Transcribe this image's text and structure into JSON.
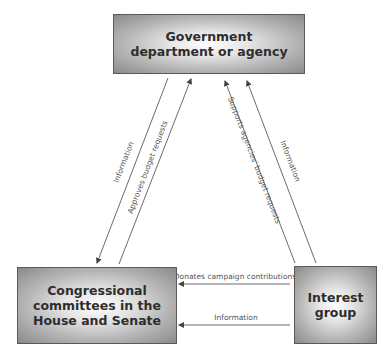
{
  "nodes": {
    "government": {
      "line1": "Government",
      "line2": "department or agency"
    },
    "congress": {
      "line1": "Congressional",
      "line2": "committees in the",
      "line3": "House and Senate"
    },
    "interest_group": {
      "line1": "Interest",
      "line2": "group"
    }
  },
  "edges": {
    "gov_to_congress_info": "Information",
    "congress_to_gov_budget": "Approves budget requests",
    "interest_to_gov_support": "Supports agencies' budget requests",
    "interest_to_gov_info": "Information",
    "interest_to_congress_donations": "Donates campaign contributions",
    "interest_to_congress_info": "Information"
  },
  "colors": {
    "box_border": "#5a5a5a",
    "box_center": "#ffffff",
    "box_edge": "#8a8a8a",
    "text": "#2e2e2e",
    "arrow": "#444444",
    "edge_label": "#555555"
  }
}
